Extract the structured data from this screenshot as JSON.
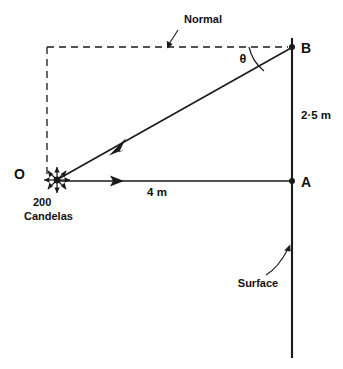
{
  "diagram": {
    "title": "Illumination geometry: point source O, surface through A and B",
    "labels": {
      "normal": "Normal",
      "theta": "θ",
      "point_b": "B",
      "point_a": "A",
      "point_o": "O",
      "height_ab": "2·5 m",
      "distance_oa": "4 m",
      "source_intensity_value": "200",
      "source_intensity_unit": "Candelas",
      "surface": "Surface"
    },
    "values": {
      "luminous_intensity_cd": 200,
      "height_ab_m": 2.5,
      "distance_oa_m": 4,
      "angle_symbol": "theta"
    },
    "colors": {
      "ink": "#1a1a1a",
      "background": "#ffffff"
    },
    "geometry": {
      "point_o": [
        57,
        180
      ],
      "point_a": [
        292,
        181
      ],
      "point_b": [
        292,
        47
      ],
      "normal_corner": [
        47,
        47
      ]
    }
  }
}
